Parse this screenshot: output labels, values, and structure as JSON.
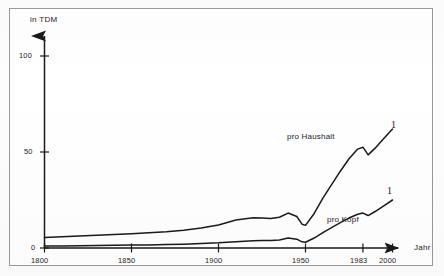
{
  "chart_data": {
    "type": "line",
    "title": "",
    "subtitle": "",
    "xlabel": "Jahr",
    "ylabel": "in TDM",
    "xlim": [
      1800,
      2000
    ],
    "ylim": [
      0,
      110
    ],
    "grid": false,
    "legend_position": "inline-annotations",
    "x_ticks": [
      "1800",
      "1850",
      "1900",
      "1950",
      "1983",
      "2000"
    ],
    "x_tick_values": [
      1800,
      1850,
      1900,
      1950,
      1983,
      2000
    ],
    "y_ticks": [
      "0",
      "50",
      "100"
    ],
    "y_tick_values": [
      0,
      50,
      100
    ],
    "series": [
      {
        "name": "pro Haushalt",
        "end_marker_label": "1",
        "x": [
          1800,
          1810,
          1820,
          1830,
          1840,
          1850,
          1860,
          1870,
          1880,
          1890,
          1900,
          1910,
          1920,
          1925,
          1930,
          1935,
          1940,
          1945,
          1948,
          1950,
          1955,
          1960,
          1965,
          1970,
          1975,
          1980,
          1983,
          1986,
          1990,
          1995,
          2000
        ],
        "values": [
          5.5,
          5.8,
          6.2,
          6.6,
          7.0,
          7.4,
          7.9,
          8.4,
          9.2,
          10.4,
          12.0,
          14.6,
          15.8,
          15.6,
          15.4,
          16.0,
          18.2,
          16.4,
          12.4,
          11.8,
          18.0,
          26.0,
          33.0,
          40.0,
          46.5,
          51.5,
          52.5,
          48.5,
          52.0,
          57.0,
          62.0
        ]
      },
      {
        "name": "pro Kopf",
        "end_marker_label": "1",
        "x": [
          1800,
          1810,
          1820,
          1830,
          1840,
          1850,
          1860,
          1870,
          1880,
          1890,
          1900,
          1910,
          1920,
          1925,
          1930,
          1935,
          1940,
          1945,
          1948,
          1950,
          1955,
          1960,
          1965,
          1970,
          1975,
          1980,
          1983,
          1986,
          1990,
          1995,
          2000
        ],
        "values": [
          1.0,
          1.1,
          1.2,
          1.3,
          1.4,
          1.5,
          1.6,
          1.8,
          2.0,
          2.3,
          2.7,
          3.3,
          3.8,
          3.9,
          3.9,
          4.2,
          5.2,
          4.6,
          3.2,
          3.0,
          5.2,
          8.0,
          10.6,
          13.2,
          15.6,
          17.6,
          18.2,
          16.9,
          19.0,
          22.0,
          25.0
        ]
      }
    ],
    "annotations": [
      {
        "text": "pro Haushalt",
        "x": 1952,
        "y": 44
      },
      {
        "text": "pro Kopf",
        "x": 1966,
        "y": 11.5
      }
    ]
  },
  "axes": {
    "y_axis_title": "in TDM",
    "x_axis_title": "Jahr"
  },
  "colors": {
    "line": "#1a1a1a",
    "axis": "#1a1a1a",
    "frame": "#9a9a9a",
    "background": "#ffffff",
    "text": "#1c1c1c"
  }
}
